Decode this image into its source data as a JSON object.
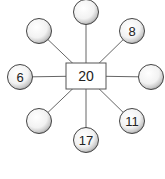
{
  "diagram": {
    "type": "star / spider number diagram",
    "center": {
      "label": "20",
      "x": 86,
      "y": 76,
      "w": 40,
      "h": 26
    },
    "nodes": [
      {
        "id": "top",
        "label": "",
        "cx": 86,
        "cy": 12
      },
      {
        "id": "top-left",
        "label": "",
        "cx": 39,
        "cy": 31
      },
      {
        "id": "top-right",
        "label": "8",
        "cx": 132,
        "cy": 31
      },
      {
        "id": "left",
        "label": "6",
        "cx": 20,
        "cy": 77
      },
      {
        "id": "right",
        "label": "",
        "cx": 151,
        "cy": 77
      },
      {
        "id": "bottom-left",
        "label": "",
        "cx": 39,
        "cy": 121
      },
      {
        "id": "bottom",
        "label": "17",
        "cx": 86,
        "cy": 140
      },
      {
        "id": "bottom-right",
        "label": "11",
        "cx": 132,
        "cy": 121
      }
    ],
    "colors": {
      "line": "#666666",
      "circle_stroke": "#444444",
      "box_stroke": "#555555"
    }
  }
}
